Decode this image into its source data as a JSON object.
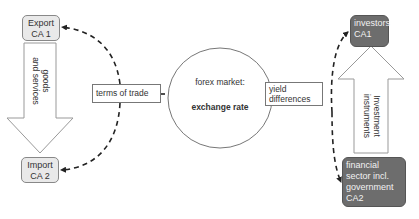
{
  "diagram": {
    "left": {
      "export_box": {
        "line1": "Export",
        "line2": "CA 1"
      },
      "import_box": {
        "line1": "Import",
        "line2": "CA 2"
      },
      "flow_arrow": {
        "line1": "goods",
        "line2": "and services",
        "direction": "down"
      }
    },
    "center": {
      "terms_of_trade_label": "terms of trade",
      "market_circle": {
        "line1": "forex market:",
        "line2": "exchange rate"
      },
      "yield_label": {
        "line1": "yield",
        "line2": "differences"
      }
    },
    "right": {
      "investors_box": {
        "line1": "investors",
        "line2": "CA1"
      },
      "financial_box": {
        "line1": "financial",
        "line2": "sector incl.",
        "line3": "government",
        "line4": "CA2"
      },
      "flow_arrow": {
        "line1": "Investment",
        "line2": "instruments",
        "direction": "up"
      }
    },
    "colors": {
      "light_box_fill": "#e9e9e9",
      "dark_box_fill": "#6d6d6d",
      "line": "#222222",
      "outline": "#888888"
    }
  }
}
